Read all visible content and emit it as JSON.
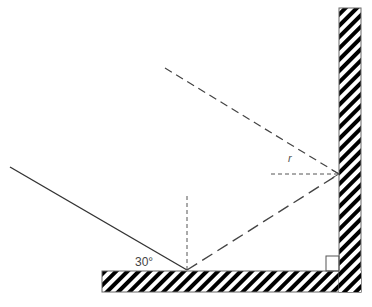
{
  "diagram": {
    "labels": {
      "incident_angle": "30°",
      "reflection_angle": "r"
    },
    "colors": {
      "ray": "#333333",
      "dashed": "#555555",
      "mirror_stroke": "#555555",
      "hatch": "#000000",
      "background": "#ffffff"
    }
  }
}
